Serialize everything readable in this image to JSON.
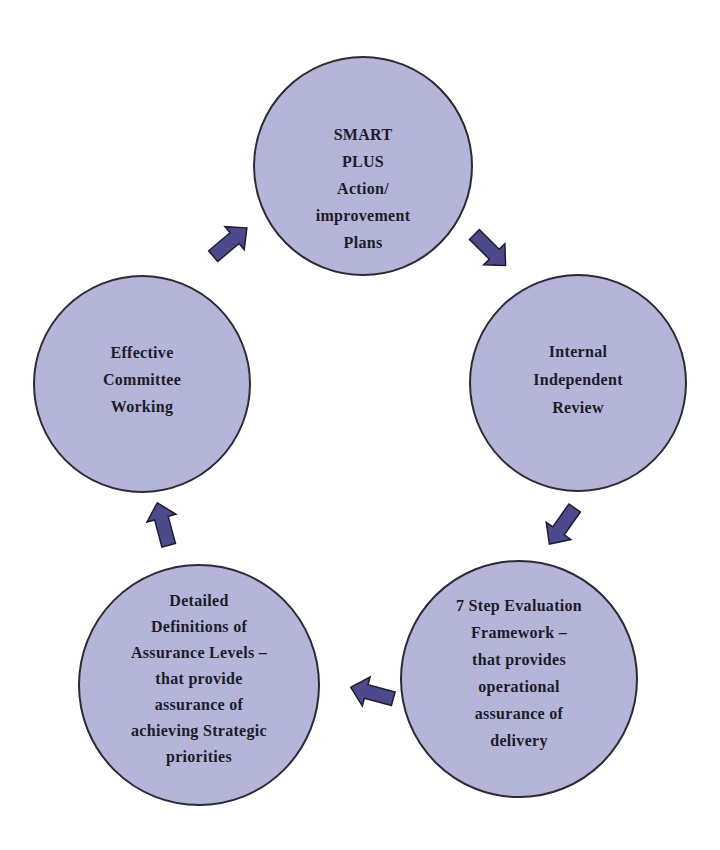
{
  "diagram": {
    "type": "cycle",
    "direction": "clockwise",
    "colors": {
      "node_fill": "#b5b5d9",
      "node_stroke": "#2b2b35",
      "arrow_fill": "#4c4a8c",
      "text": "#1c1c2a"
    },
    "nodes": [
      {
        "id": "smart-plus",
        "lines": [
          "SMART",
          "PLUS",
          "Action/",
          "improvement",
          "Plans"
        ]
      },
      {
        "id": "internal-review",
        "lines": [
          "Internal",
          "Independent",
          "Review"
        ]
      },
      {
        "id": "evaluation-framework",
        "lines": [
          "7 Step Evaluation",
          "Framework –",
          "that provides",
          "operational",
          "assurance of",
          "delivery"
        ]
      },
      {
        "id": "assurance-levels",
        "lines": [
          "Detailed",
          "Definitions of",
          "Assurance Levels –",
          "that provide",
          "assurance of",
          "achieving Strategic",
          "priorities"
        ]
      },
      {
        "id": "committee-working",
        "lines": [
          "Effective",
          "Committee",
          "Working"
        ]
      }
    ],
    "edges": [
      {
        "from": "smart-plus",
        "to": "internal-review"
      },
      {
        "from": "internal-review",
        "to": "evaluation-framework"
      },
      {
        "from": "evaluation-framework",
        "to": "assurance-levels"
      },
      {
        "from": "assurance-levels",
        "to": "committee-working"
      },
      {
        "from": "committee-working",
        "to": "smart-plus"
      }
    ]
  }
}
